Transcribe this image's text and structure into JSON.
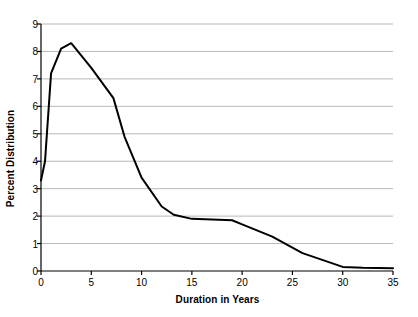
{
  "chart_data": {
    "type": "line",
    "title": "",
    "xlabel": "Duration in Years",
    "ylabel": "Percent Distribution",
    "xlim": [
      0,
      35
    ],
    "ylim": [
      0,
      9
    ],
    "xticks": [
      0,
      5,
      10,
      15,
      20,
      25,
      30,
      35
    ],
    "yticks": [
      0,
      1,
      2,
      3,
      4,
      5,
      6,
      7,
      8,
      9
    ],
    "grid": "horizontal",
    "legend": "none",
    "line_color": "#000000",
    "gridline_color": "#b8b8b8",
    "axis_color": "#000000",
    "series": [
      {
        "name": "Percent Distribution",
        "x": [
          0,
          0.4,
          1,
          2,
          3,
          5,
          7.2,
          8.3,
          10,
          12,
          13.2,
          15,
          19,
          20,
          23,
          26,
          30,
          32,
          35
        ],
        "values": [
          3.3,
          4.0,
          7.2,
          8.1,
          8.3,
          7.4,
          6.3,
          4.9,
          3.4,
          2.35,
          2.05,
          1.9,
          1.85,
          1.7,
          1.25,
          0.65,
          0.15,
          0.12,
          0.1
        ]
      }
    ]
  },
  "axes": {
    "x_tick_labels": [
      "0",
      "5",
      "10",
      "15",
      "20",
      "25",
      "30",
      "35"
    ],
    "y_tick_labels": [
      "0",
      "1",
      "2",
      "3",
      "4",
      "5",
      "6",
      "7",
      "8",
      "9"
    ]
  }
}
